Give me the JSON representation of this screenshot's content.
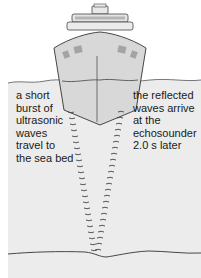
{
  "diagram": {
    "left_label": "a short\nburst of\nultrasonic\nwaves\ntravel to\nthe sea bed",
    "right_label": "the reflected\nwaves arrive\nat the\nechosounder\n2.0 s later",
    "colors": {
      "water": "#ececec",
      "ship_hull": "#d6d6d6",
      "ship_outline": "#333333",
      "windows": "#a8a8a8",
      "wave_marks": "#444444",
      "line": "#333333"
    },
    "elements": [
      "ship",
      "sea-surface",
      "outgoing-waves",
      "reflected-waves",
      "sea-bed"
    ]
  }
}
